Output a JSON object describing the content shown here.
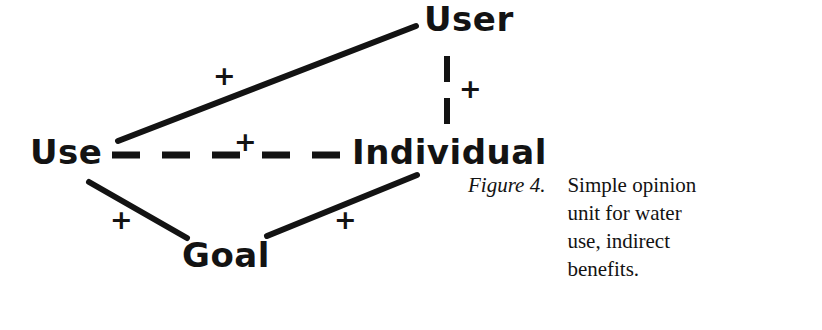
{
  "figure": {
    "nodes": [
      {
        "id": "use",
        "label": "Use",
        "x": 30,
        "y": 135
      },
      {
        "id": "user",
        "label": "User",
        "x": 424,
        "y": 2
      },
      {
        "id": "individual",
        "label": "Individual",
        "x": 352,
        "y": 135
      },
      {
        "id": "goal",
        "label": "Goal",
        "x": 182,
        "y": 238
      }
    ],
    "edges": [
      {
        "id": "use-user",
        "from": "use",
        "to": "user",
        "style": "solid",
        "sign": "+",
        "sign_x": 213,
        "sign_y": 62
      },
      {
        "id": "use-individual",
        "from": "use",
        "to": "individual",
        "style": "dashed",
        "sign": "+",
        "sign_x": 234,
        "sign_y": 128
      },
      {
        "id": "user-individual",
        "from": "user",
        "to": "individual",
        "style": "dashed",
        "sign": "+",
        "sign_x": 459,
        "sign_y": 75
      },
      {
        "id": "use-goal",
        "from": "use",
        "to": "goal",
        "style": "solid",
        "sign": "+",
        "sign_x": 110,
        "sign_y": 206
      },
      {
        "id": "goal-individual",
        "from": "goal",
        "to": "individual",
        "style": "solid",
        "sign": "+",
        "sign_x": 334,
        "sign_y": 206
      }
    ],
    "stroke_color": "#131313"
  },
  "caption": {
    "figure_label": "Figure 4.",
    "lines": [
      "Simple opinion",
      "unit for water",
      "use, indirect",
      "benefits."
    ]
  }
}
